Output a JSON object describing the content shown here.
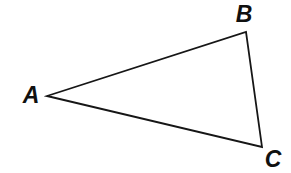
{
  "figure": {
    "kind": "geometry-diagram",
    "shape": "triangle",
    "background_color": "#ffffff",
    "stroke_color": "#161616",
    "stroke_width": 1.8,
    "label_color": "#101010",
    "width": 291,
    "height": 173,
    "vertices": [
      {
        "id": "A",
        "label": "A",
        "x": 47,
        "y": 96,
        "label_x": 31,
        "label_y": 95
      },
      {
        "id": "B",
        "label": "B",
        "x": 246,
        "y": 32,
        "label_x": 244,
        "label_y": 14
      },
      {
        "id": "C",
        "label": "C",
        "x": 262,
        "y": 147,
        "label_x": 273,
        "label_y": 159
      }
    ],
    "edges": [
      {
        "id": "AB",
        "from": "A",
        "to": "B"
      },
      {
        "id": "BC",
        "from": "B",
        "to": "C"
      },
      {
        "id": "CA",
        "from": "C",
        "to": "A"
      }
    ]
  }
}
